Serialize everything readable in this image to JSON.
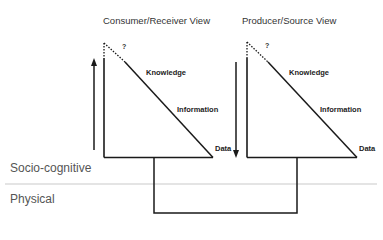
{
  "diagram": {
    "views": [
      {
        "id": "consumer",
        "title": "Consumer/Receiver View",
        "unknown_marker": "?",
        "labels": {
          "top": "Knowledge",
          "middle": "Information",
          "bottom": "Data"
        },
        "arrow_direction": "up"
      },
      {
        "id": "producer",
        "title": "Producer/Source View",
        "unknown_marker": "?",
        "labels": {
          "top": "Knowledge",
          "middle": "Information",
          "bottom": "Data"
        },
        "arrow_direction": "down"
      }
    ],
    "layers": {
      "upper": "Socio-cognitive",
      "lower": "Physical"
    },
    "colors": {
      "line": "#1a1a1a",
      "divider": "#bbbbbb",
      "layer_text": "#555555"
    }
  }
}
